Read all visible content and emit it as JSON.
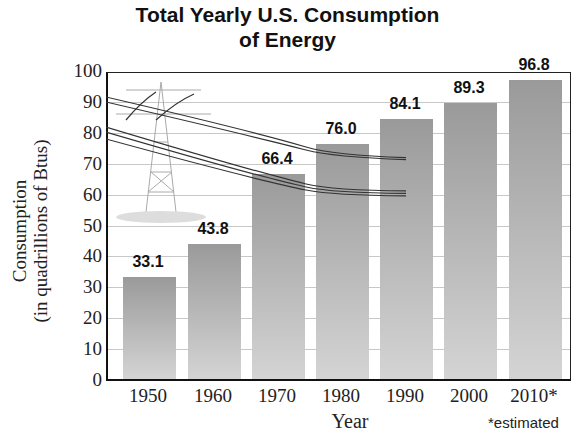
{
  "chart_data": {
    "type": "bar",
    "title": "Total Yearly U.S. Consumption of Energy",
    "title_lines": [
      "Total Yearly U.S. Consumption",
      "of Energy"
    ],
    "xlabel": "Year",
    "ylabel": "Consumption (in quadrillions of Btus)",
    "ylabel_lines": [
      "Consumption",
      "(in quadrillions of Btus)"
    ],
    "categories": [
      "1950",
      "1960",
      "1970",
      "1980",
      "1990",
      "2000",
      "2010*"
    ],
    "values": [
      33.1,
      43.8,
      66.4,
      76.0,
      84.1,
      89.3,
      96.8
    ],
    "value_labels": [
      "33.1",
      "43.8",
      "66.4",
      "76.0",
      "84.1",
      "89.3",
      "96.8"
    ],
    "yticks": [
      "0",
      "10",
      "20",
      "30",
      "40",
      "50",
      "60",
      "70",
      "80",
      "90",
      "100"
    ],
    "ylim": [
      0,
      100
    ],
    "grid": true,
    "legend": null,
    "annotations": [
      "*estimated"
    ],
    "decoration": "power transmission tower with power lines"
  },
  "colors": {
    "bar": "#b8b8b8",
    "grid": "#c8c8c8",
    "axis": "#111111"
  }
}
